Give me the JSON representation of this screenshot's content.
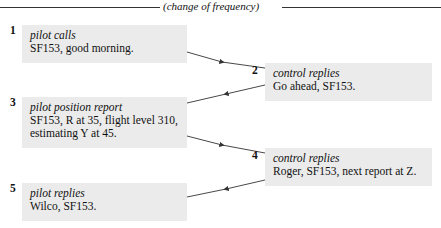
{
  "header": {
    "label": "(change of frequency)"
  },
  "steps": [
    {
      "number": "1",
      "role": "pilot calls",
      "lines": [
        "SF153, good morning."
      ]
    },
    {
      "number": "2",
      "role": "control replies",
      "lines": [
        "Go ahead, SF153."
      ]
    },
    {
      "number": "3",
      "role": "pilot position report",
      "lines": [
        "SF153, R at 35, flight level 310,",
        "estimating Y at 45."
      ]
    },
    {
      "number": "4",
      "role": "control replies",
      "lines": [
        "Roger, SF153, next report at Z."
      ]
    },
    {
      "number": "5",
      "role": "pilot replies",
      "lines": [
        "Wilco, SF153."
      ]
    }
  ],
  "colors": {
    "box_fill": "#ebebeb",
    "line": "#333333"
  }
}
